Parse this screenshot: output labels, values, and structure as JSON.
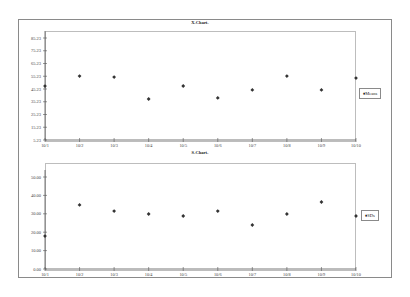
{
  "chart_data": [
    {
      "type": "scatter",
      "title": "X-Chart-",
      "xlabel": "",
      "ylabel": "",
      "categories": [
        "10/1",
        "10/2",
        "10/3",
        "10/4",
        "10/5",
        "10/6",
        "10/7",
        "10/8",
        "10/9",
        "10/10"
      ],
      "series": [
        {
          "name": "Means",
          "marker": "diamond",
          "values": [
            47.5,
            55.4,
            54.6,
            37.4,
            47.6,
            38.2,
            44.5,
            55.4,
            44.5,
            53.8
          ]
        }
      ],
      "yticks": [
        "5.23",
        "15.23",
        "25.23",
        "35.23",
        "45.23",
        "55.23",
        "65.23",
        "75.23",
        "85.23"
      ],
      "ylim": [
        5.23,
        85.23
      ],
      "grid": false,
      "legend_position": "right"
    },
    {
      "type": "scatter",
      "title": "S-Chart-",
      "xlabel": "",
      "ylabel": "",
      "categories": [
        "10/1",
        "10/2",
        "10/3",
        "10/4",
        "10/5",
        "10/6",
        "10/7",
        "10/8",
        "10/9",
        "10/10"
      ],
      "series": [
        {
          "name": "SDs",
          "marker": "diamond",
          "values": [
            17.9,
            34.8,
            31.5,
            29.9,
            28.8,
            31.5,
            23.9,
            29.9,
            36.4,
            28.8
          ]
        }
      ],
      "yticks": [
        "0.00",
        "10.00",
        "20.00",
        "30.00",
        "40.00",
        "50.00"
      ],
      "ylim": [
        0,
        50
      ],
      "grid": false,
      "legend_position": "right"
    }
  ],
  "charts": {
    "top": {
      "title": "X-Chart-",
      "legend": "♦Means"
    },
    "bottom": {
      "title": "S-Chart-",
      "legend": "♦SDs"
    }
  },
  "colors": {
    "marker": "#333333",
    "axis": "#555555",
    "border": "#8a8a8a"
  }
}
